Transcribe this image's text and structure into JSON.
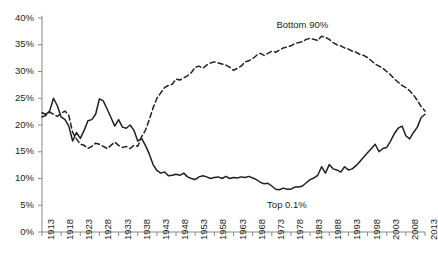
{
  "chart_data": {
    "type": "line",
    "title": "",
    "subtitle": "",
    "xlabel": "",
    "ylabel": "",
    "xlim": [
      1913,
      2013
    ],
    "ylim": [
      0,
      40
    ],
    "ytick_labels": [
      "0%",
      "5%",
      "10%",
      "15%",
      "20%",
      "25%",
      "30%",
      "35%",
      "40%"
    ],
    "ytick_values": [
      0,
      5,
      10,
      15,
      20,
      25,
      30,
      35,
      40
    ],
    "xtick_labels": [
      "1913",
      "1918",
      "1923",
      "1928",
      "1933",
      "1938",
      "1943",
      "1948",
      "1953",
      "1958",
      "1963",
      "1968",
      "1973",
      "1978",
      "1983",
      "1988",
      "1993",
      "1998",
      "2003",
      "2008",
      "2013"
    ],
    "xtick_values": [
      1913,
      1918,
      1923,
      1928,
      1933,
      1938,
      1943,
      1948,
      1953,
      1958,
      1963,
      1968,
      1973,
      1978,
      1983,
      1988,
      1993,
      1998,
      2003,
      2008,
      2013
    ],
    "grid": false,
    "legend": "inline-annotations",
    "annotations": [
      {
        "text": "Bottom 90%",
        "x": 1981,
        "y": 38.6
      },
      {
        "text": "Top 0.1%",
        "x": 1977,
        "y": 5.0
      }
    ],
    "series": [
      {
        "name": "Top 0.1%",
        "style": "solid",
        "color": "#231f20",
        "x": [
          1913,
          1914,
          1915,
          1916,
          1917,
          1918,
          1919,
          1920,
          1921,
          1922,
          1923,
          1924,
          1925,
          1926,
          1927,
          1928,
          1929,
          1930,
          1931,
          1932,
          1933,
          1934,
          1935,
          1936,
          1937,
          1938,
          1939,
          1940,
          1941,
          1942,
          1943,
          1944,
          1945,
          1946,
          1947,
          1948,
          1949,
          1950,
          1951,
          1952,
          1953,
          1954,
          1955,
          1956,
          1957,
          1958,
          1959,
          1960,
          1961,
          1962,
          1963,
          1964,
          1965,
          1966,
          1967,
          1968,
          1969,
          1970,
          1971,
          1972,
          1973,
          1974,
          1975,
          1976,
          1977,
          1978,
          1979,
          1980,
          1981,
          1982,
          1983,
          1984,
          1985,
          1986,
          1987,
          1988,
          1989,
          1990,
          1991,
          1992,
          1993,
          1994,
          1995,
          1996,
          1997,
          1998,
          1999,
          2000,
          2001,
          2002,
          2003,
          2004,
          2005,
          2006,
          2007,
          2008,
          2009,
          2010,
          2011,
          2012,
          2013
        ],
        "y": [
          22.3,
          22.0,
          22.6,
          25.0,
          23.6,
          21.5,
          21.0,
          19.8,
          17.0,
          18.6,
          17.5,
          19.0,
          20.8,
          21.0,
          22.0,
          24.9,
          24.5,
          23.0,
          21.4,
          19.8,
          21.0,
          19.6,
          19.4,
          20.0,
          19.0,
          17.0,
          17.5,
          16.2,
          14.6,
          12.6,
          11.5,
          11.0,
          11.2,
          10.5,
          10.6,
          10.8,
          10.6,
          11.0,
          10.3,
          10.0,
          9.8,
          10.3,
          10.5,
          10.3,
          10.0,
          10.2,
          10.3,
          10.0,
          10.4,
          10.0,
          10.2,
          10.1,
          10.3,
          10.2,
          10.4,
          10.1,
          9.8,
          9.3,
          9.0,
          9.1,
          8.6,
          8.0,
          7.9,
          8.2,
          8.0,
          8.0,
          8.4,
          8.4,
          8.6,
          9.2,
          9.8,
          10.1,
          10.6,
          12.2,
          11.0,
          12.6,
          11.8,
          11.6,
          11.2,
          12.2,
          11.6,
          11.8,
          12.4,
          13.2,
          14.0,
          14.8,
          15.6,
          16.4,
          15.0,
          15.6,
          15.8,
          17.0,
          18.4,
          19.4,
          19.8,
          18.0,
          17.4,
          18.6,
          19.6,
          21.4,
          22.0
        ]
      },
      {
        "name": "Bottom 90%",
        "style": "dashed",
        "color": "#231f20",
        "x": [
          1913,
          1914,
          1915,
          1916,
          1917,
          1918,
          1919,
          1920,
          1921,
          1922,
          1923,
          1924,
          1925,
          1926,
          1927,
          1928,
          1929,
          1930,
          1931,
          1932,
          1933,
          1934,
          1935,
          1936,
          1937,
          1938,
          1939,
          1940,
          1941,
          1942,
          1943,
          1944,
          1945,
          1946,
          1947,
          1948,
          1949,
          1950,
          1951,
          1952,
          1953,
          1954,
          1955,
          1956,
          1957,
          1958,
          1959,
          1960,
          1961,
          1962,
          1963,
          1964,
          1965,
          1966,
          1967,
          1968,
          1969,
          1970,
          1971,
          1972,
          1973,
          1974,
          1975,
          1976,
          1977,
          1978,
          1979,
          1980,
          1981,
          1982,
          1983,
          1984,
          1985,
          1986,
          1987,
          1988,
          1989,
          1990,
          1991,
          1992,
          1993,
          1994,
          1995,
          1996,
          1997,
          1998,
          1999,
          2000,
          2001,
          2002,
          2003,
          2004,
          2005,
          2006,
          2007,
          2008,
          2009,
          2010,
          2011,
          2012,
          2013
        ],
        "y": [
          21.5,
          21.8,
          22.4,
          22.0,
          21.6,
          22.2,
          22.6,
          21.8,
          18.6,
          17.4,
          16.4,
          16.2,
          15.6,
          16.0,
          16.6,
          16.4,
          16.0,
          15.6,
          16.2,
          16.8,
          16.2,
          15.8,
          16.0,
          15.6,
          16.2,
          16.0,
          17.8,
          19.0,
          21.0,
          23.2,
          25.0,
          26.0,
          27.0,
          27.4,
          27.6,
          28.6,
          28.4,
          28.8,
          29.2,
          29.8,
          30.8,
          31.0,
          30.6,
          31.2,
          31.6,
          31.8,
          31.6,
          31.4,
          31.2,
          30.8,
          30.2,
          30.6,
          31.0,
          31.8,
          32.0,
          32.4,
          33.0,
          33.4,
          33.0,
          33.4,
          33.8,
          33.6,
          34.0,
          34.4,
          34.6,
          34.8,
          35.2,
          35.4,
          35.6,
          36.0,
          36.2,
          36.0,
          35.8,
          36.6,
          36.4,
          36.0,
          35.4,
          35.0,
          34.8,
          34.4,
          34.2,
          33.8,
          33.6,
          33.2,
          33.0,
          32.6,
          32.0,
          31.4,
          31.0,
          30.6,
          30.0,
          29.4,
          28.6,
          28.0,
          27.4,
          27.0,
          26.4,
          25.6,
          24.6,
          23.4,
          22.6
        ]
      }
    ]
  }
}
